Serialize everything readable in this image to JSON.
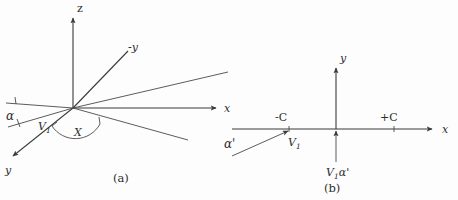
{
  "figure": {
    "background_color": "#fdfdfd",
    "ink_color": "#3a3a3a",
    "panel_a": {
      "caption": "(a)",
      "axis_z_label": "z",
      "axis_x_label": "x",
      "axis_minus_y_label": "-y",
      "axis_y_label": "y",
      "angle_alpha_label": "α",
      "angle_chi_label": "X",
      "vector_v1_label": "V",
      "vector_v1_subscript": "1"
    },
    "panel_b": {
      "caption": "(b)",
      "axis_y_label": "y",
      "axis_x_label": "x",
      "marker_minus_c": "-C",
      "marker_plus_c": "+C",
      "vector_v1_label": "V",
      "vector_v1_subscript": "1",
      "angle_alpha_prime_label": "α'",
      "bottom_label_v1": "V",
      "bottom_label_v1_subscript": "1",
      "bottom_label_alpha_prime": "α'"
    }
  }
}
